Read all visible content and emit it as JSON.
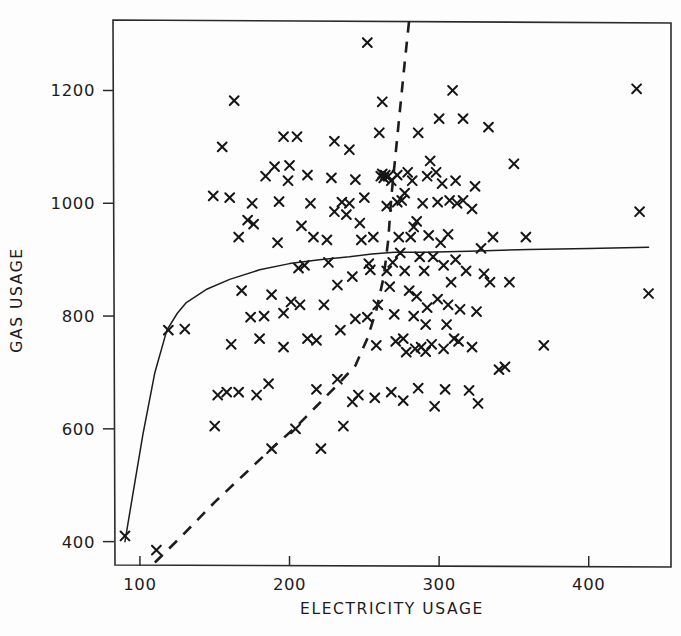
{
  "figure": {
    "width": 681,
    "height": 636,
    "background_color": "#fdfdfd",
    "ink_color": "#1c1c1c"
  },
  "axes": {
    "x_title": "ELECTRICITY USAGE",
    "y_title": "GAS USAGE",
    "x_ticks": [
      100,
      200,
      300,
      400
    ],
    "y_ticks": [
      400,
      600,
      800,
      1000,
      1200
    ],
    "x_tick_labels": [
      "100",
      "200",
      "300",
      "400"
    ],
    "y_tick_labels": [
      "400",
      "600",
      "800",
      "1000",
      "1200"
    ],
    "frame": {
      "left": 113,
      "top": 20,
      "right": 671,
      "bottom": 567
    },
    "grid": false,
    "legend": "none"
  },
  "chart_data": {
    "type": "scatter",
    "title": "",
    "xlabel": "ELECTRICITY USAGE",
    "ylabel": "GAS USAGE",
    "xlim": [
      82,
      455
    ],
    "ylim": [
      355,
      1325
    ],
    "xticks": [
      100,
      200,
      300,
      400
    ],
    "yticks": [
      400,
      600,
      800,
      1000,
      1200
    ],
    "grid": false,
    "legend_position": "none",
    "marker": "x",
    "series": [
      {
        "name": "households",
        "marker": "x",
        "color": "#161616",
        "points": [
          [
            90,
            410
          ],
          [
            111,
            385
          ],
          [
            119,
            775
          ],
          [
            130,
            777
          ],
          [
            149,
            1013
          ],
          [
            150,
            605
          ],
          [
            152,
            660
          ],
          [
            155,
            1100
          ],
          [
            158,
            665
          ],
          [
            161,
            750
          ],
          [
            163,
            1182
          ],
          [
            166,
            665
          ],
          [
            168,
            845
          ],
          [
            172,
            970
          ],
          [
            175,
            1000
          ],
          [
            176,
            963
          ],
          [
            178,
            660
          ],
          [
            180,
            760
          ],
          [
            183,
            800
          ],
          [
            186,
            680
          ],
          [
            188,
            565
          ],
          [
            190,
            1065
          ],
          [
            192,
            930
          ],
          [
            193,
            1003
          ],
          [
            196,
            805
          ],
          [
            199,
            1040
          ],
          [
            201,
            825
          ],
          [
            204,
            600
          ],
          [
            205,
            1118
          ],
          [
            207,
            820
          ],
          [
            208,
            960
          ],
          [
            210,
            890
          ],
          [
            212,
            760
          ],
          [
            214,
            1000
          ],
          [
            216,
            940
          ],
          [
            218,
            670
          ],
          [
            221,
            565
          ],
          [
            223,
            820
          ],
          [
            225,
            935
          ],
          [
            228,
            1045
          ],
          [
            230,
            1110
          ],
          [
            232,
            855
          ],
          [
            234,
            775
          ],
          [
            236,
            605
          ],
          [
            238,
            980
          ],
          [
            240,
            1000
          ],
          [
            242,
            870
          ],
          [
            244,
            795
          ],
          [
            246,
            660
          ],
          [
            248,
            935
          ],
          [
            250,
            1010
          ],
          [
            252,
            1285
          ],
          [
            254,
            882
          ],
          [
            256,
            940
          ],
          [
            257,
            655
          ],
          [
            259,
            820
          ],
          [
            261,
            1048
          ],
          [
            262,
            1052
          ],
          [
            263,
            1045
          ],
          [
            264,
            1050
          ],
          [
            265,
            995
          ],
          [
            266,
            1048
          ],
          [
            267,
            852
          ],
          [
            268,
            1040
          ],
          [
            269,
            895
          ],
          [
            270,
            803
          ],
          [
            271,
            755
          ],
          [
            272,
            1050
          ],
          [
            273,
            940
          ],
          [
            274,
            912
          ],
          [
            275,
            1005
          ],
          [
            276,
            760
          ],
          [
            277,
            880
          ],
          [
            278,
            736
          ],
          [
            279,
            1055
          ],
          [
            280,
            845
          ],
          [
            281,
            940
          ],
          [
            282,
            1040
          ],
          [
            283,
            800
          ],
          [
            284,
            742
          ],
          [
            285,
            968
          ],
          [
            286,
            1125
          ],
          [
            287,
            905
          ],
          [
            288,
            745
          ],
          [
            289,
            1000
          ],
          [
            290,
            880
          ],
          [
            291,
            737
          ],
          [
            292,
            815
          ],
          [
            293,
            943
          ],
          [
            294,
            1075
          ],
          [
            295,
            750
          ],
          [
            296,
            905
          ],
          [
            297,
            640
          ],
          [
            298,
            1055
          ],
          [
            299,
            830
          ],
          [
            300,
            1150
          ],
          [
            301,
            930
          ],
          [
            302,
            1035
          ],
          [
            303,
            890
          ],
          [
            304,
            670
          ],
          [
            305,
            785
          ],
          [
            306,
            945
          ],
          [
            307,
            1005
          ],
          [
            308,
            860
          ],
          [
            309,
            1200
          ],
          [
            310,
            760
          ],
          [
            311,
            900
          ],
          [
            312,
            1000
          ],
          [
            313,
            755
          ],
          [
            314,
            812
          ],
          [
            316,
            1150
          ],
          [
            318,
            880
          ],
          [
            320,
            668
          ],
          [
            322,
            990
          ],
          [
            324,
            1030
          ],
          [
            326,
            645
          ],
          [
            328,
            920
          ],
          [
            330,
            875
          ],
          [
            333,
            1135
          ],
          [
            336,
            940
          ],
          [
            340,
            705
          ],
          [
            344,
            710
          ],
          [
            350,
            1070
          ],
          [
            358,
            940
          ],
          [
            370,
            748
          ],
          [
            200,
            1067
          ],
          [
            212,
            1050
          ],
          [
            230,
            985
          ],
          [
            240,
            1095
          ],
          [
            262,
            1180
          ],
          [
            196,
            1118
          ],
          [
            184,
            1048
          ],
          [
            226,
            895
          ],
          [
            244,
            1042
          ],
          [
            253,
            893
          ],
          [
            265,
            880
          ],
          [
            277,
            1018
          ],
          [
            285,
            835
          ],
          [
            292,
            1048
          ],
          [
            299,
            1002
          ],
          [
            306,
            820
          ],
          [
            316,
            1005
          ],
          [
            325,
            808
          ],
          [
            334,
            860
          ],
          [
            252,
            798
          ],
          [
            258,
            748
          ],
          [
            268,
            665
          ],
          [
            276,
            650
          ],
          [
            286,
            672
          ],
          [
            232,
            688
          ],
          [
            242,
            648
          ],
          [
            218,
            757
          ],
          [
            206,
            885
          ],
          [
            196,
            745
          ],
          [
            188,
            838
          ],
          [
            174,
            798
          ],
          [
            166,
            940
          ],
          [
            160,
            1010
          ],
          [
            235,
            1002
          ],
          [
            247,
            965
          ],
          [
            260,
            1125
          ],
          [
            272,
            1002
          ],
          [
            283,
            958
          ],
          [
            291,
            785
          ],
          [
            303,
            742
          ],
          [
            311,
            1040
          ],
          [
            322,
            745
          ],
          [
            347,
            860
          ],
          [
            432,
            1203
          ],
          [
            434,
            985
          ],
          [
            440,
            840
          ]
        ]
      }
    ],
    "curves": [
      {
        "name": "solid-regression-curve",
        "style": "solid",
        "color": "#1d1d1d",
        "points": [
          [
            90,
            400
          ],
          [
            95,
            480
          ],
          [
            102,
            590
          ],
          [
            110,
            700
          ],
          [
            118,
            775
          ],
          [
            125,
            805
          ],
          [
            131,
            824
          ],
          [
            145,
            848
          ],
          [
            160,
            865
          ],
          [
            180,
            882
          ],
          [
            200,
            893
          ],
          [
            220,
            900
          ],
          [
            240,
            905
          ],
          [
            255,
            910
          ],
          [
            270,
            913
          ],
          [
            290,
            913
          ],
          [
            320,
            915
          ],
          [
            360,
            918
          ],
          [
            400,
            920
          ],
          [
            440,
            922
          ]
        ]
      },
      {
        "name": "dashed-regression-curve",
        "style": "dashed",
        "color": "#1d1d1d",
        "points": [
          [
            110,
            363
          ],
          [
            128,
            410
          ],
          [
            150,
            470
          ],
          [
            170,
            520
          ],
          [
            188,
            565
          ],
          [
            205,
            605
          ],
          [
            218,
            640
          ],
          [
            232,
            678
          ],
          [
            244,
            712
          ],
          [
            252,
            760
          ],
          [
            258,
            810
          ],
          [
            263,
            870
          ],
          [
            266,
            935
          ],
          [
            268,
            1010
          ],
          [
            271,
            1090
          ],
          [
            274,
            1170
          ],
          [
            277,
            1250
          ],
          [
            280,
            1325
          ]
        ]
      }
    ]
  }
}
